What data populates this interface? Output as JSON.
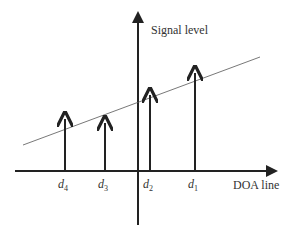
{
  "labels": {
    "y_axis": "Signal level",
    "x_axis": "DOA line"
  },
  "arrows": [
    {
      "name": "d",
      "sub": "4",
      "x": 65,
      "top": 117
    },
    {
      "name": "d",
      "sub": "3",
      "x": 105,
      "top": 121
    },
    {
      "name": "d",
      "sub": "2",
      "x": 150,
      "top": 93
    },
    {
      "name": "d",
      "sub": "1",
      "x": 195,
      "top": 71
    }
  ],
  "threshold_line": {
    "x1": 23,
    "y1": 145,
    "x2": 260,
    "y2": 57
  },
  "colors": {
    "axis": "#222222",
    "line": "#555555"
  }
}
